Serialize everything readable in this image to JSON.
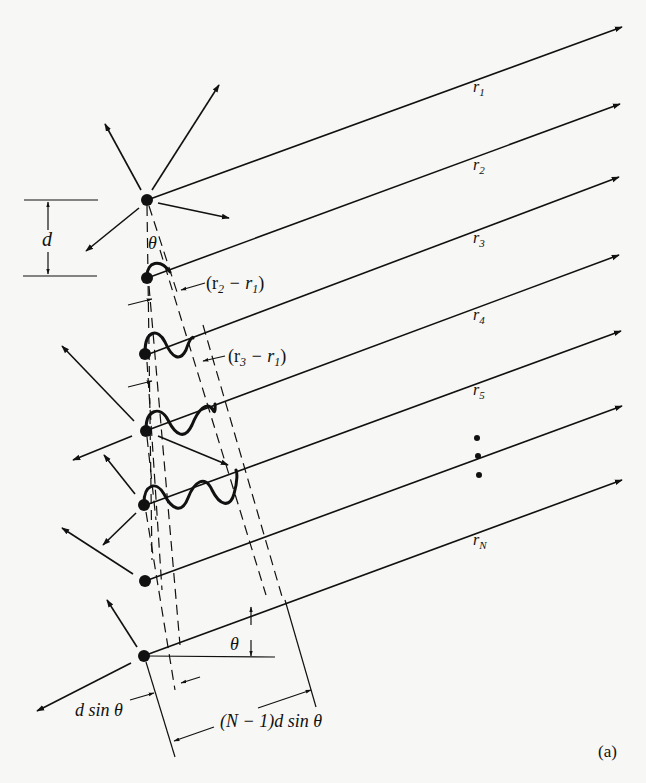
{
  "figure": {
    "panel_label": "(a)",
    "ray_labels": [
      {
        "base": "r",
        "sub": "1"
      },
      {
        "base": "r",
        "sub": "2"
      },
      {
        "base": "r",
        "sub": "3"
      },
      {
        "base": "r",
        "sub": "4"
      },
      {
        "base": "r",
        "sub": "5"
      },
      {
        "base": "r",
        "sub": "N"
      }
    ],
    "spacing_label": "d",
    "angle_label_top": "θ",
    "angle_label_bottom": "θ",
    "path_diff_2": {
      "open": "(r",
      "s1": "2",
      "mid": " − r",
      "s2": "1",
      "close": ")"
    },
    "path_diff_3": {
      "open": "(r",
      "s1": "3",
      "mid": " − r",
      "s2": "1",
      "close": ")"
    },
    "dsin_label": "d sin θ",
    "total_label": "(N − 1)d sin θ",
    "ellipsis": "⋮",
    "element_count_shown": 7,
    "colors": {
      "ink": "#111111",
      "paper": "#f7f7f5"
    }
  }
}
